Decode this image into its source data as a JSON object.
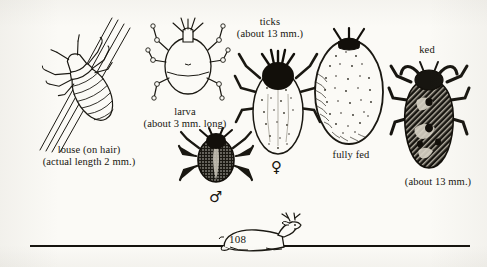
{
  "page": {
    "width": 487,
    "height": 267,
    "background_color": "#fbfaf6",
    "ink_color": "#17150f",
    "page_number": "108",
    "kind": "book-page-illustration-plate"
  },
  "figures": [
    {
      "id": "louse",
      "icon_name": "louse-on-hair-illustration",
      "caption_line1": "louse (on hair)",
      "caption_line2": "(actual length 2 mm.)"
    },
    {
      "id": "larva",
      "icon_name": "tick-larva-illustration",
      "caption_line1": "larva",
      "caption_line2": "(about 3 mm. long)"
    },
    {
      "id": "ticks",
      "icon_name": "tick-pair-illustration",
      "caption_line1": "ticks",
      "caption_line2": "(about 13 mm.)"
    },
    {
      "id": "male-tick",
      "icon_name": "male-tick-illustration",
      "symbol": "♂"
    },
    {
      "id": "female-tick",
      "icon_name": "female-tick-illustration",
      "symbol": "♀"
    },
    {
      "id": "fully-fed-tick",
      "icon_name": "engorged-tick-illustration",
      "caption_line1": "fully fed"
    },
    {
      "id": "ked",
      "icon_name": "deer-ked-illustration",
      "caption_line1": "ked",
      "caption_line2": "(about 13 mm.)"
    },
    {
      "id": "deer",
      "icon_name": "resting-deer-illustration"
    }
  ],
  "labels": {
    "louse_l1": "louse (on hair)",
    "louse_l2": "(actual length 2 mm.)",
    "larva_l1": "larva",
    "larva_l2": "(about 3 mm. long)",
    "ticks_l1": "ticks",
    "ticks_l2": "(about 13 mm.)",
    "fully_fed": "fully fed",
    "ked_l1": "ked",
    "ked_l2": "(about 13 mm.)",
    "male_symbol": "♂",
    "female_symbol": "♀",
    "page_number": "108"
  }
}
